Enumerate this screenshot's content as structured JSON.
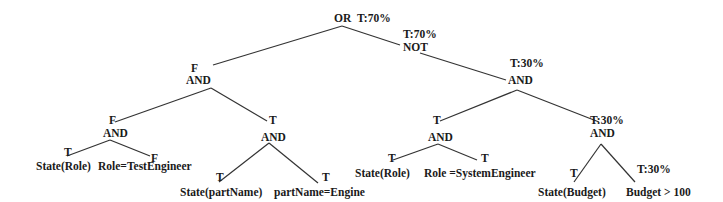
{
  "diagram": {
    "type": "fault-tree",
    "nodes": {
      "root": {
        "op": "OR",
        "value": "T:70%"
      },
      "not": {
        "op": "NOT",
        "value": "T:70%"
      },
      "and_left": {
        "op": "AND",
        "value": "F"
      },
      "and_ll": {
        "op": "AND",
        "value": "F"
      },
      "and_lr": {
        "op": "AND",
        "value": "T"
      },
      "and_right": {
        "op": "AND",
        "value": "T:30%"
      },
      "and_rl": {
        "op": "AND",
        "value": "T"
      },
      "and_rr": {
        "op": "AND",
        "value": "T:30%"
      }
    },
    "leaves": {
      "ll_a": {
        "label": "State(Role)",
        "value": "T"
      },
      "ll_b": {
        "label": "Role=TestEngineer",
        "value": "F"
      },
      "lr_a": {
        "label": "State(partName)",
        "value": "T"
      },
      "lr_b": {
        "label": "partName=Engine",
        "value": "T"
      },
      "rl_a": {
        "label": "State(Role)",
        "value": "T"
      },
      "rl_b": {
        "label": "Role =SystemEngineer",
        "value": "T"
      },
      "rr_a": {
        "label": "State(Budget)",
        "value": "T"
      },
      "rr_b": {
        "label": "Budget > 100",
        "value": "T:30%"
      }
    }
  }
}
